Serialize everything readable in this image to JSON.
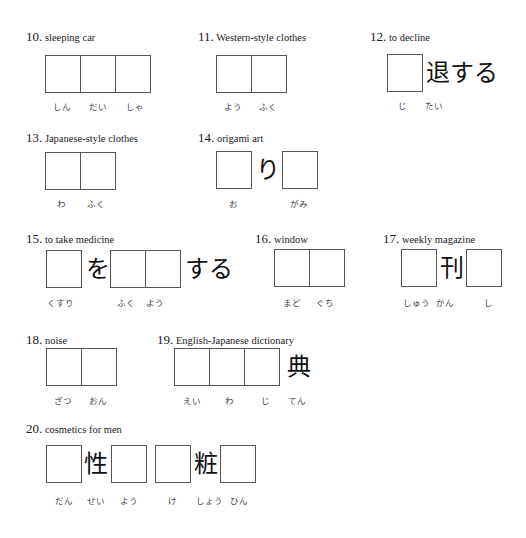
{
  "items": [
    {
      "number": "10.",
      "english": "sleeping car",
      "readings": [
        "しん",
        "だい",
        "しゃ"
      ]
    },
    {
      "number": "11.",
      "english": "Western-style clothes",
      "readings": [
        "よう",
        "ふく"
      ]
    },
    {
      "number": "12.",
      "english": "to decline",
      "suffix": "退する",
      "readings": [
        "じ",
        "たい"
      ]
    },
    {
      "number": "13.",
      "english": "Japanese-style clothes",
      "readings": [
        "わ",
        "ふく"
      ]
    },
    {
      "number": "14.",
      "english": "origami art",
      "middle": "り",
      "readings": [
        "お",
        "がみ"
      ]
    },
    {
      "number": "15.",
      "english": "to take medicine",
      "particle": "を",
      "suffix": "する",
      "readings": [
        "くすり",
        "ふく",
        "よう"
      ]
    },
    {
      "number": "16.",
      "english": "window",
      "readings": [
        "まど",
        "ぐち"
      ]
    },
    {
      "number": "17.",
      "english": "weekly magazine",
      "middle": "刊",
      "readings": [
        "しゅう",
        "かん",
        "し"
      ]
    },
    {
      "number": "18.",
      "english": "noise",
      "readings": [
        "ざつ",
        "おん"
      ]
    },
    {
      "number": "19.",
      "english": "English-Japanese dictionary",
      "suffix": "典",
      "readings": [
        "えい",
        "わ",
        "じ",
        "てん"
      ]
    },
    {
      "number": "20.",
      "english": "cosmetics for men",
      "kanji1": "性",
      "kanji2": "粧",
      "readings": [
        "だん",
        "せい",
        "よう",
        "け",
        "しょう",
        "ひん"
      ]
    }
  ]
}
